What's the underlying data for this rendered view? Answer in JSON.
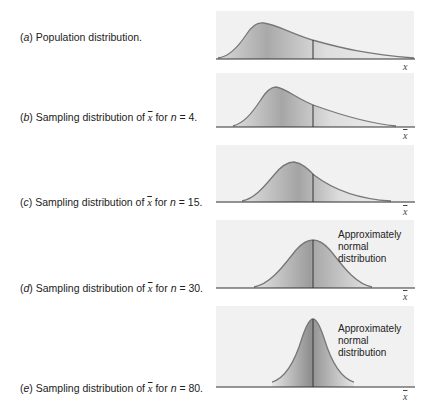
{
  "figure": {
    "panels": [
      {
        "id": "a",
        "label_letter": "a",
        "label_text": "Population distribution.",
        "axis_label": "x",
        "note": null
      },
      {
        "id": "b",
        "label_letter": "b",
        "label_prefix": "Sampling distribution of",
        "xbar": "x",
        "label_for": "for",
        "n_symbol": "n",
        "n_value": "= 4.",
        "axis_label": "x",
        "note": null
      },
      {
        "id": "c",
        "label_letter": "c",
        "label_prefix": "Sampling distribution of",
        "xbar": "x",
        "label_for": "for",
        "n_symbol": "n",
        "n_value": "= 15.",
        "axis_label": "x",
        "note": null
      },
      {
        "id": "d",
        "label_letter": "d",
        "label_prefix": "Sampling distribution of",
        "xbar": "x",
        "label_for": "for",
        "n_symbol": "n",
        "n_value": "= 30.",
        "axis_label": "x",
        "note_lines": [
          "Approximately",
          "normal",
          "distribution"
        ]
      },
      {
        "id": "e",
        "label_letter": "e",
        "label_prefix": "Sampling distribution of",
        "xbar": "x",
        "label_for": "for",
        "n_symbol": "n",
        "n_value": "= 80.",
        "axis_label": "x",
        "note_lines": [
          "Approximately",
          "normal",
          "distribution"
        ]
      }
    ],
    "colors": {
      "panel_bg": "#f1f1f1",
      "curve": "#7a7a7a",
      "fill_dark": "#9a9a9a",
      "fill_light": "#f0f0f0",
      "axis": "#333333",
      "mean_line": "#333333"
    }
  }
}
